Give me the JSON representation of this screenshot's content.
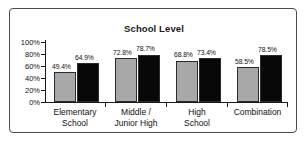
{
  "chart_data": {
    "type": "bar",
    "title": "School Level",
    "xlabel": "",
    "ylabel": "",
    "ylim": [
      0,
      100
    ],
    "grid": false,
    "legend": "none",
    "y_ticks": [
      "0%",
      "20%",
      "40%",
      "60%",
      "80%",
      "100%"
    ],
    "y_tick_values": [
      0,
      20,
      40,
      60,
      80,
      100
    ],
    "categories": [
      "Elementary\nSchool",
      "Middle /\nJunior High",
      "High\nSchool",
      "Combination"
    ],
    "category_lines": [
      [
        "Elementary",
        "School"
      ],
      [
        "Middle /",
        "Junior High"
      ],
      [
        "High",
        "School"
      ],
      [
        "Combination",
        ""
      ]
    ],
    "series": [
      {
        "name": "series-a",
        "color": "#a8a8a8",
        "values": [
          49.4,
          72.8,
          68.8,
          58.5
        ],
        "labels": [
          "49.4%",
          "72.8%",
          "68.8%",
          "58.5%"
        ]
      },
      {
        "name": "series-b",
        "color": "#080808",
        "values": [
          64.9,
          78.7,
          73.4,
          78.5
        ],
        "labels": [
          "64.9%",
          "78.7%",
          "73.4%",
          "78.5%"
        ]
      }
    ]
  }
}
